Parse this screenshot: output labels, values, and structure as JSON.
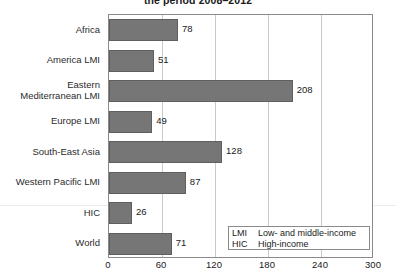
{
  "chart_data": {
    "type": "bar",
    "orientation": "horizontal",
    "title": "the period 2008–2012",
    "xlabel": "",
    "ylabel": "",
    "xlim": [
      0,
      300
    ],
    "xticks": [
      0,
      60,
      120,
      180,
      240,
      300
    ],
    "grid": true,
    "grid_axis": "x",
    "bar_color": "#767676",
    "categories": [
      "Africa",
      "America LMI",
      "Eastern\nMediterranean LMI",
      "Europe LMI",
      "South-East Asia",
      "Western Pacific LMI",
      "HIC",
      "World"
    ],
    "values": [
      78,
      51,
      208,
      49,
      128,
      87,
      26,
      71
    ],
    "data_labels": [
      "78",
      "51",
      "208",
      "49",
      "128",
      "87",
      "26",
      "71"
    ],
    "legend": {
      "position": "bottom-right",
      "entries": [
        {
          "key": "LMI",
          "description": "Low- and middle-income"
        },
        {
          "key": "HIC",
          "description": "High-income"
        }
      ]
    }
  }
}
